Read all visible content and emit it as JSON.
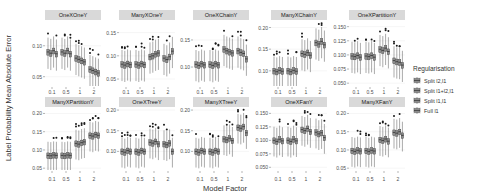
{
  "chart_data": {
    "type": "boxplot",
    "title": "",
    "xlabel": "Model Factor",
    "ylabel": "Label Probability Mean Absolute Error",
    "categories": [
      "0.1",
      "0.5",
      "1",
      "2"
    ],
    "legend": {
      "title": "Regularisation",
      "position": "right",
      "entries": [
        "Split l2,l1",
        "Split l1+l2,l1",
        "Split l1,l1",
        "Full l1"
      ]
    },
    "panels": [
      {
        "name": "OneXOneY",
        "yticks": [
          0.05,
          0.1
        ],
        "ylim": [
          0.035,
          0.14
        ],
        "medians": [
          [
            0.09,
            0.088,
            0.092,
            0.087
          ],
          [
            0.09,
            0.088,
            0.092,
            0.087
          ],
          [
            0.08,
            0.078,
            0.076,
            0.074
          ],
          [
            0.062,
            0.06,
            0.058,
            0.056
          ]
        ]
      },
      {
        "name": "ManyXOneY",
        "yticks": [
          0.05,
          0.1,
          0.15
        ],
        "ylim": [
          0.035,
          0.175
        ],
        "medians": [
          [
            0.082,
            0.08,
            0.083,
            0.081
          ],
          [
            0.082,
            0.08,
            0.083,
            0.081
          ],
          [
            0.098,
            0.1,
            0.104,
            0.106
          ],
          [
            0.095,
            0.092,
            0.098,
            0.11
          ]
        ]
      },
      {
        "name": "OneXChainY",
        "yticks": [
          0.1,
          0.15
        ],
        "ylim": [
          0.065,
          0.185
        ],
        "medians": [
          [
            0.105,
            0.103,
            0.106,
            0.104
          ],
          [
            0.105,
            0.103,
            0.106,
            0.104
          ],
          [
            0.133,
            0.13,
            0.128,
            0.126
          ],
          [
            0.13,
            0.127,
            0.125,
            0.115
          ]
        ]
      },
      {
        "name": "ManyXChainY",
        "yticks": [
          0.1,
          0.15,
          0.2
        ],
        "ylim": [
          0.065,
          0.215
        ],
        "medians": [
          [
            0.1,
            0.098,
            0.101,
            0.099
          ],
          [
            0.1,
            0.098,
            0.101,
            0.099
          ],
          [
            0.14,
            0.138,
            0.142,
            0.136
          ],
          [
            0.165,
            0.162,
            0.168,
            0.16
          ]
        ]
      },
      {
        "name": "OneXPartitionY",
        "yticks": [
          0.05,
          0.075,
          0.1,
          0.125,
          0.15
        ],
        "ylim": [
          0.045,
          0.16
        ],
        "medians": [
          [
            0.098,
            0.097,
            0.099,
            0.096
          ],
          [
            0.098,
            0.097,
            0.099,
            0.096
          ],
          [
            0.11,
            0.108,
            0.112,
            0.106
          ],
          [
            0.09,
            0.088,
            0.087,
            0.082
          ]
        ]
      },
      {
        "name": "ManyXPartitionY",
        "yticks": [
          0.05,
          0.1,
          0.15,
          0.2
        ],
        "ylim": [
          0.045,
          0.215
        ],
        "medians": [
          [
            0.085,
            0.084,
            0.086,
            0.085
          ],
          [
            0.085,
            0.084,
            0.086,
            0.085
          ],
          [
            0.118,
            0.116,
            0.12,
            0.122
          ],
          [
            0.14,
            0.138,
            0.142,
            0.14
          ]
        ]
      },
      {
        "name": "OneXTreeY",
        "yticks": [
          0.1,
          0.15,
          0.2
        ],
        "ylim": [
          0.055,
          0.205
        ],
        "medians": [
          [
            0.1,
            0.098,
            0.102,
            0.1
          ],
          [
            0.1,
            0.098,
            0.102,
            0.1
          ],
          [
            0.122,
            0.12,
            0.124,
            0.118
          ],
          [
            0.118,
            0.116,
            0.12,
            0.1
          ]
        ]
      },
      {
        "name": "ManyXTreeY",
        "yticks": [
          0.1,
          0.15,
          0.2
        ],
        "ylim": [
          0.055,
          0.205
        ],
        "medians": [
          [
            0.1,
            0.098,
            0.102,
            0.1
          ],
          [
            0.1,
            0.098,
            0.102,
            0.1
          ],
          [
            0.13,
            0.128,
            0.132,
            0.126
          ],
          [
            0.158,
            0.156,
            0.16,
            0.145
          ]
        ]
      },
      {
        "name": "OneXFanY",
        "yticks": [
          0.05,
          0.075,
          0.1,
          0.125,
          0.15
        ],
        "ylim": [
          0.045,
          0.16
        ],
        "medians": [
          [
            0.1,
            0.098,
            0.102,
            0.099
          ],
          [
            0.1,
            0.098,
            0.102,
            0.099
          ],
          [
            0.12,
            0.118,
            0.122,
            0.116
          ],
          [
            0.115,
            0.112,
            0.114,
            0.105
          ]
        ]
      },
      {
        "name": "ManyXFanY",
        "yticks": [
          0.05,
          0.1,
          0.15,
          0.2
        ],
        "ylim": [
          0.045,
          0.215
        ],
        "medians": [
          [
            0.098,
            0.096,
            0.099,
            0.097
          ],
          [
            0.098,
            0.096,
            0.099,
            0.097
          ],
          [
            0.128,
            0.126,
            0.13,
            0.124
          ],
          [
            0.148,
            0.146,
            0.15,
            0.14
          ]
        ]
      }
    ]
  }
}
